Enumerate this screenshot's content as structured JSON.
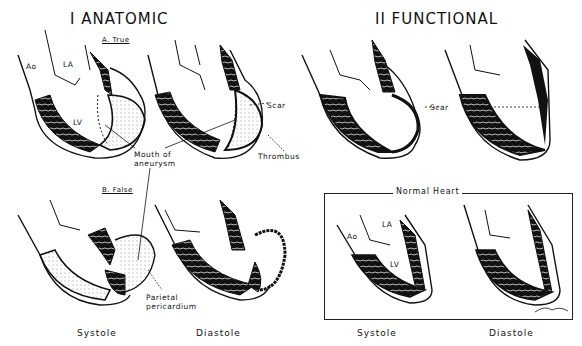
{
  "sections": {
    "anatomic": {
      "title": "I ANATOMIC"
    },
    "functional": {
      "title": "II FUNCTIONAL"
    }
  },
  "subsections": {
    "true": "A. True",
    "false": "B. False"
  },
  "labels": {
    "ao": "Ao",
    "la": "LA",
    "lv": "LV",
    "scar_left": "Scar",
    "scar_right": "Scar",
    "thrombus": "Thrombus",
    "mouth_line1": "Mouth of",
    "mouth_line2": "aneurysm",
    "parietal_line1": "Parietal",
    "parietal_line2": "pericardium",
    "normal_ao": "Ao",
    "normal_la": "LA",
    "normal_lv": "LV"
  },
  "normal_heart": {
    "title": "Normal Heart"
  },
  "captions": {
    "left_systole": "Systole",
    "left_diastole": "Diastole",
    "right_systole": "Systole",
    "right_diastole": "Diastole"
  },
  "colors": {
    "ink": "#111111",
    "background": "#ffffff",
    "stipple": "#bbbbbb"
  }
}
